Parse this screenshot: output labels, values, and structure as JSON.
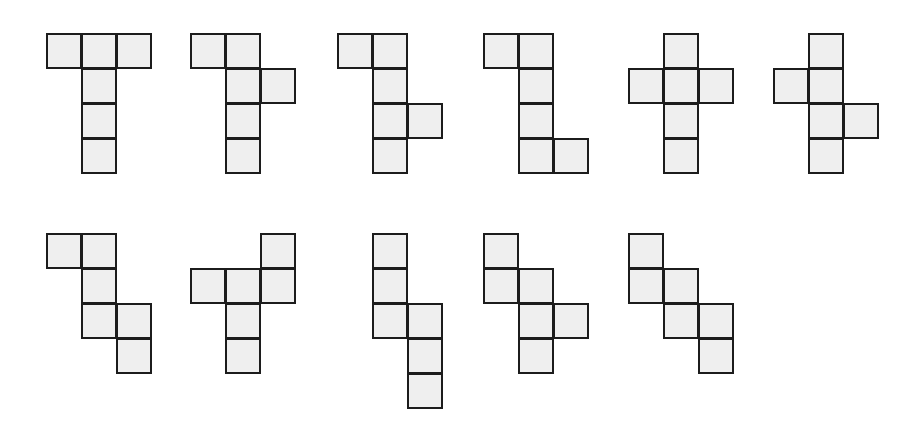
{
  "cell_size": 36,
  "colors": {
    "fill": "#efefef",
    "stroke": "#1c1c1c",
    "background": "#ffffff"
  },
  "nets": [
    {
      "id": 1,
      "origin": [
        46,
        33
      ],
      "cells": [
        [
          0,
          0
        ],
        [
          1,
          0
        ],
        [
          2,
          0
        ],
        [
          1,
          1
        ],
        [
          1,
          2
        ],
        [
          1,
          3
        ]
      ]
    },
    {
      "id": 2,
      "origin": [
        190,
        33
      ],
      "cells": [
        [
          0,
          0
        ],
        [
          1,
          0
        ],
        [
          1,
          1
        ],
        [
          2,
          1
        ],
        [
          1,
          2
        ],
        [
          1,
          3
        ]
      ]
    },
    {
      "id": 3,
      "origin": [
        337,
        33
      ],
      "cells": [
        [
          0,
          0
        ],
        [
          1,
          0
        ],
        [
          1,
          1
        ],
        [
          1,
          2
        ],
        [
          2,
          2
        ],
        [
          1,
          3
        ]
      ]
    },
    {
      "id": 4,
      "origin": [
        483,
        33
      ],
      "cells": [
        [
          0,
          0
        ],
        [
          1,
          0
        ],
        [
          1,
          1
        ],
        [
          1,
          2
        ],
        [
          1,
          3
        ],
        [
          2,
          3
        ]
      ]
    },
    {
      "id": 5,
      "origin": [
        628,
        33
      ],
      "cells": [
        [
          1,
          0
        ],
        [
          0,
          1
        ],
        [
          1,
          1
        ],
        [
          2,
          1
        ],
        [
          1,
          2
        ],
        [
          1,
          3
        ]
      ]
    },
    {
      "id": 6,
      "origin": [
        773,
        33
      ],
      "cells": [
        [
          1,
          0
        ],
        [
          0,
          1
        ],
        [
          1,
          1
        ],
        [
          1,
          2
        ],
        [
          2,
          2
        ],
        [
          1,
          3
        ]
      ]
    },
    {
      "id": 7,
      "origin": [
        46,
        233
      ],
      "cells": [
        [
          0,
          0
        ],
        [
          1,
          0
        ],
        [
          1,
          1
        ],
        [
          1,
          2
        ],
        [
          2,
          2
        ],
        [
          2,
          3
        ]
      ]
    },
    {
      "id": 8,
      "origin": [
        190,
        233
      ],
      "cells": [
        [
          2,
          0
        ],
        [
          0,
          1
        ],
        [
          1,
          1
        ],
        [
          2,
          1
        ],
        [
          1,
          2
        ],
        [
          1,
          3
        ]
      ]
    },
    {
      "id": 9,
      "origin": [
        372,
        233
      ],
      "cells": [
        [
          0,
          0
        ],
        [
          0,
          1
        ],
        [
          0,
          2
        ],
        [
          1,
          2
        ],
        [
          1,
          3
        ],
        [
          1,
          4
        ]
      ]
    },
    {
      "id": 10,
      "origin": [
        483,
        233
      ],
      "cells": [
        [
          0,
          0
        ],
        [
          0,
          1
        ],
        [
          1,
          1
        ],
        [
          1,
          2
        ],
        [
          2,
          2
        ],
        [
          1,
          3
        ]
      ]
    },
    {
      "id": 11,
      "origin": [
        628,
        233
      ],
      "cells": [
        [
          0,
          0
        ],
        [
          0,
          1
        ],
        [
          1,
          1
        ],
        [
          1,
          2
        ],
        [
          2,
          2
        ],
        [
          2,
          3
        ]
      ]
    }
  ]
}
